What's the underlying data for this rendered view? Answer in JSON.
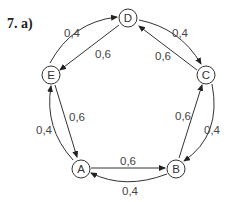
{
  "figure": {
    "label": "7.  a)"
  },
  "nodes": [
    {
      "id": "D",
      "label": "D"
    },
    {
      "id": "C",
      "label": "C"
    },
    {
      "id": "B",
      "label": "B"
    },
    {
      "id": "A",
      "label": "A"
    },
    {
      "id": "E",
      "label": "E"
    }
  ],
  "edges": [
    {
      "from": "E",
      "to": "D",
      "label": "0,4",
      "style": "curved"
    },
    {
      "from": "D",
      "to": "E",
      "label": "0,6",
      "style": "straight"
    },
    {
      "from": "D",
      "to": "C",
      "label": "0,4",
      "style": "curved"
    },
    {
      "from": "C",
      "to": "D",
      "label": "0,6",
      "style": "straight"
    },
    {
      "from": "C",
      "to": "B",
      "label": "0,4",
      "style": "curved"
    },
    {
      "from": "B",
      "to": "C",
      "label": "0,6",
      "style": "straight"
    },
    {
      "from": "B",
      "to": "A",
      "label": "0,4",
      "style": "curved"
    },
    {
      "from": "A",
      "to": "B",
      "label": "0,6",
      "style": "straight"
    },
    {
      "from": "A",
      "to": "E",
      "label": "0,4",
      "style": "curved"
    },
    {
      "from": "E",
      "to": "A",
      "label": "0,6",
      "style": "straight"
    }
  ]
}
